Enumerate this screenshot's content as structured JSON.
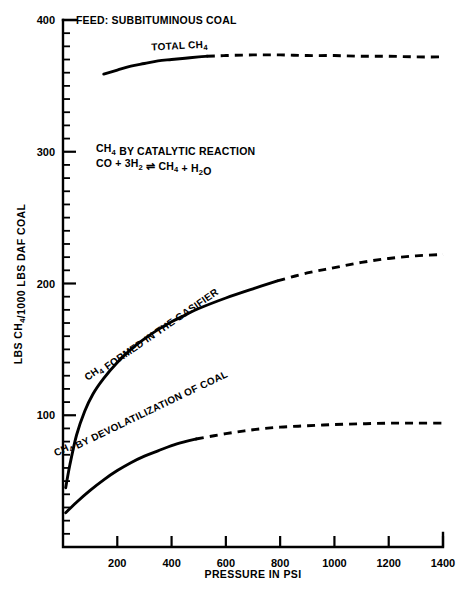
{
  "figure": {
    "feed_note": "FEED: SUBBITUMINOUS COAL",
    "reaction_note_line1": "CH4 BY CATALYTIC REACTION",
    "reaction_note_line2": "CO + 3H2 ⇌ CH4 + H2O",
    "background_color": "#ffffff",
    "ink_color": "#000000"
  },
  "chart_data": {
    "type": "line",
    "title": "",
    "subtitle": "",
    "xlabel": "PRESSURE IN PSI",
    "ylabel": "LBS CH4/1000 LBS DAF COAL",
    "xlim": [
      0,
      1400
    ],
    "ylim": [
      0,
      400
    ],
    "xticks": [
      200,
      400,
      600,
      800,
      1000,
      1200,
      1400
    ],
    "xtick_labels": [
      "200",
      "400",
      "600",
      "800",
      "1000",
      "1200",
      "1400"
    ],
    "yticks": [
      100,
      200,
      300,
      400
    ],
    "ytick_labels": [
      "100",
      "200",
      "300",
      "400"
    ],
    "y_minor_tick_step": 10,
    "grid": false,
    "legend": "none",
    "annotations": [
      {
        "name": "feed-note",
        "text": "FEED: SUBBITUMINOUS COAL",
        "x": 180,
        "y": 395
      },
      {
        "name": "catalytic-reaction-note",
        "text": "CH4 BY CATALYTIC REACTION / CO + 3H2 ⇌ CH4 + H2O",
        "x": 160,
        "y": 305
      }
    ],
    "series": [
      {
        "name": "TOTAL CH4",
        "label": "TOTAL CH4",
        "label_x": 430,
        "label_y": 378,
        "solid_until_x": 530,
        "x": [
          150,
          200,
          250,
          300,
          350,
          400,
          450,
          500,
          530,
          600,
          700,
          800,
          900,
          1000,
          1100,
          1200,
          1300,
          1400
        ],
        "y": [
          359,
          362,
          365,
          367,
          369,
          370,
          371,
          372,
          372.5,
          373,
          373.5,
          373.5,
          373,
          373,
          372.5,
          372.5,
          372,
          372
        ]
      },
      {
        "name": "CH4 FORMED IN THE GASIFIER",
        "label": "CH4 FORMED IN THE GASIFIER",
        "label_x": 330,
        "label_y": 160,
        "solid_until_x": 790,
        "x": [
          10,
          25,
          50,
          80,
          110,
          150,
          200,
          250,
          300,
          350,
          400,
          450,
          500,
          600,
          700,
          790,
          900,
          1000,
          1100,
          1200,
          1300,
          1400
        ],
        "y": [
          45,
          62,
          85,
          103,
          116,
          128,
          140,
          150,
          158,
          165,
          171,
          176,
          181,
          189,
          196,
          202,
          208,
          212,
          216,
          219,
          221,
          222
        ]
      },
      {
        "name": "CH4 BY DEVOLATILIZATION OF COAL",
        "label": "CH4 BY DEVOLATILIZATION OF COAL",
        "label_x": 290,
        "label_y": 100,
        "solid_until_x": 490,
        "x": [
          10,
          50,
          100,
          150,
          200,
          250,
          300,
          350,
          400,
          450,
          490,
          600,
          700,
          800,
          900,
          1000,
          1100,
          1200,
          1300,
          1400
        ],
        "y": [
          26,
          34,
          43,
          51,
          58,
          64,
          69,
          73,
          77,
          80,
          82,
          86,
          89,
          91,
          92,
          93,
          93.5,
          94,
          94,
          94
        ]
      }
    ]
  }
}
